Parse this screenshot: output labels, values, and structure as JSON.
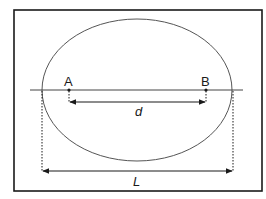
{
  "diagram": {
    "points": [
      {
        "label": "A",
        "x": 69,
        "y": 90
      },
      {
        "label": "B",
        "x": 206,
        "y": 90
      }
    ],
    "dimensions": {
      "inner": {
        "label": "d",
        "from": "A",
        "to": "B"
      },
      "outer": {
        "label": "L",
        "description": "ellipse width along horizontal line"
      }
    },
    "shapes": {
      "frame": "rectangle",
      "ellipse": "ellipse",
      "axis": "horizontal line through A and B"
    },
    "colors": {
      "stroke": "#1a1a1a",
      "ellipse_stroke": "#555555",
      "background": "#ffffff"
    }
  }
}
